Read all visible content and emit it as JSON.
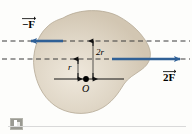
{
  "figure": {
    "background_color": "#fdfdfb",
    "blob": {
      "name": "irregular-rigid-body",
      "fill_color": "#d9cfbd",
      "stroke_color": "#b9ae99",
      "highlight_color": "#efe8dc"
    },
    "axis_lines": {
      "dashed_color": "#3a3a3a",
      "solid_color": "#1a1a1a"
    },
    "arrows": {
      "color": "#2f6096",
      "left": {
        "name": "force-vector-negative-F",
        "label": "−F",
        "direction": "left",
        "magnitude_text": "F"
      },
      "right": {
        "name": "force-vector-2F",
        "label": "2F",
        "direction": "right",
        "magnitude_text": "2F"
      }
    },
    "labels": {
      "force_left": "−F",
      "force_right": "2F",
      "distance_upper": "2r",
      "distance_lower": "r",
      "origin": "O"
    },
    "measurements": {
      "upper_distance_value": "2r",
      "lower_distance_value": "r",
      "origin_point": "O"
    }
  },
  "footer": {
    "badge_icon": "book-icon"
  }
}
